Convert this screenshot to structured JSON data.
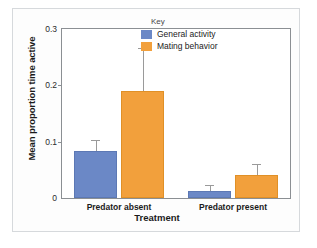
{
  "chart_data": {
    "type": "bar",
    "title": "",
    "xlabel": "Treatment",
    "ylabel": "Mean proportion time active",
    "categories": [
      "Predator absent",
      "Predator present"
    ],
    "ylim": [
      0,
      0.3
    ],
    "yticks": [
      "0",
      "0.1",
      "0.2",
      "0.3"
    ],
    "ytick_values": [
      0,
      0.1,
      0.2,
      0.3
    ],
    "grid": false,
    "legend_title": "Key",
    "legend_position": "top-right inside",
    "series": [
      {
        "name": "General activity",
        "color": "#6b88c6",
        "values": [
          0.083,
          0.012
        ],
        "errors": [
          0.018,
          0.009
        ]
      },
      {
        "name": "Mating behavior",
        "color": "#f2a03c",
        "values": [
          0.19,
          0.041
        ],
        "errors": [
          0.074,
          0.017
        ]
      }
    ]
  },
  "axes": {
    "y_title": "Mean proportion time active",
    "x_title": "Treatment",
    "y_tick_0": "0",
    "y_tick_1": "0.1",
    "y_tick_2": "0.2",
    "y_tick_3": "0.3",
    "x_cat_0": "Predator absent",
    "x_cat_1": "Predator present"
  },
  "legend": {
    "title": "Key",
    "entries": [
      {
        "label": "General activity",
        "color": "#6b88c6"
      },
      {
        "label": "Mating behavior",
        "color": "#f2a03c"
      }
    ]
  },
  "colors": {
    "series_blue": "#6b88c6",
    "series_orange": "#f2a03c",
    "frame": "#8b8f93",
    "figure_border": "#d6d9dc",
    "error_bar": "#9a9a9a"
  }
}
